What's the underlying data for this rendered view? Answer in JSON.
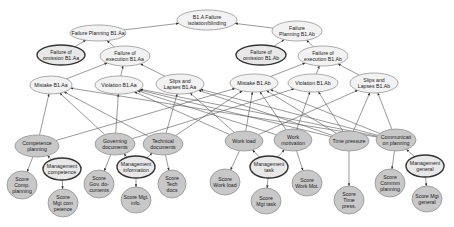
{
  "diagram": {
    "type": "bayesian-network",
    "nodes": [
      {
        "id": "b1a",
        "lines": [
          "B1.A Failure",
          "isolation/blinding"
        ],
        "x": 207,
        "y": 20,
        "rx": 30,
        "ry": 10,
        "style": "white"
      },
      {
        "id": "fp_aa",
        "lines": [
          "Failure Planning B1.Aa"
        ],
        "x": 98,
        "y": 33,
        "rx": 28,
        "ry": 8,
        "style": "white"
      },
      {
        "id": "fp_ab",
        "lines": [
          "Failure",
          "Planning B1.Ab"
        ],
        "x": 297,
        "y": 31,
        "rx": 25,
        "ry": 10,
        "style": "white"
      },
      {
        "id": "fo_aa",
        "lines": [
          "Failure of",
          "omission B1.Aa"
        ],
        "x": 61,
        "y": 55,
        "rx": 24,
        "ry": 10,
        "style": "bold"
      },
      {
        "id": "fe_aa",
        "lines": [
          "Failure of",
          "execution B1.Aa"
        ],
        "x": 125,
        "y": 56,
        "rx": 25,
        "ry": 10,
        "style": "white"
      },
      {
        "id": "fo_ab",
        "lines": [
          "Failure of",
          "omission B1.Ab"
        ],
        "x": 261,
        "y": 55,
        "rx": 25,
        "ry": 10,
        "style": "bold"
      },
      {
        "id": "fe_ab",
        "lines": [
          "Failure of",
          "execution B1.Ab"
        ],
        "x": 323,
        "y": 56,
        "rx": 25,
        "ry": 10,
        "style": "white"
      },
      {
        "id": "mis_aa",
        "lines": [
          "Mistake B1.Aa"
        ],
        "x": 51,
        "y": 85,
        "rx": 21,
        "ry": 9,
        "style": "white"
      },
      {
        "id": "vio_aa",
        "lines": [
          "Violation B1.Aa"
        ],
        "x": 119,
        "y": 85,
        "rx": 24,
        "ry": 9,
        "style": "white"
      },
      {
        "id": "sl_aa",
        "lines": [
          "Slips and",
          "Lapses B1.Aa"
        ],
        "x": 180,
        "y": 84,
        "rx": 24,
        "ry": 10,
        "style": "white"
      },
      {
        "id": "mis_ab",
        "lines": [
          "Mistake B1.Ab"
        ],
        "x": 254,
        "y": 83,
        "rx": 24,
        "ry": 9,
        "style": "white"
      },
      {
        "id": "vio_ab",
        "lines": [
          "Violation B1.Ab"
        ],
        "x": 313,
        "y": 83,
        "rx": 25,
        "ry": 9,
        "style": "white"
      },
      {
        "id": "sl_ab",
        "lines": [
          "Slips and",
          "Lapses B1.Ab"
        ],
        "x": 374,
        "y": 83,
        "rx": 24,
        "ry": 10,
        "style": "white"
      },
      {
        "id": "comp_pl",
        "lines": [
          "Competence",
          "planning"
        ],
        "x": 37,
        "y": 146,
        "rx": 22,
        "ry": 11,
        "style": "grey"
      },
      {
        "id": "gov_doc",
        "lines": [
          "Governing",
          "documents"
        ],
        "x": 115,
        "y": 144,
        "rx": 20,
        "ry": 11,
        "style": "grey"
      },
      {
        "id": "tech_doc",
        "lines": [
          "Technical",
          "documents"
        ],
        "x": 163,
        "y": 144,
        "rx": 20,
        "ry": 11,
        "style": "grey"
      },
      {
        "id": "work_load",
        "lines": [
          "Work load"
        ],
        "x": 244,
        "y": 141,
        "rx": 19,
        "ry": 10,
        "style": "grey"
      },
      {
        "id": "work_mot",
        "lines": [
          "Work",
          "motivation"
        ],
        "x": 293,
        "y": 140,
        "rx": 19,
        "ry": 11,
        "style": "grey"
      },
      {
        "id": "time_pr",
        "lines": [
          "Time pressure"
        ],
        "x": 349,
        "y": 141,
        "rx": 20,
        "ry": 10,
        "style": "grey"
      },
      {
        "id": "comm_pl",
        "lines": [
          "Communicati",
          "on planning"
        ],
        "x": 396,
        "y": 140,
        "rx": 20,
        "ry": 11,
        "style": "grey"
      },
      {
        "id": "mgt_comp",
        "lines": [
          "Management",
          "competence"
        ],
        "x": 62,
        "y": 169,
        "rx": 19,
        "ry": 11,
        "style": "bold"
      },
      {
        "id": "mgt_info",
        "lines": [
          "Management",
          "information"
        ],
        "x": 136,
        "y": 167,
        "rx": 19,
        "ry": 11,
        "style": "bold"
      },
      {
        "id": "mgt_task",
        "lines": [
          "Management",
          "task"
        ],
        "x": 269,
        "y": 167,
        "rx": 19,
        "ry": 11,
        "style": "bold"
      },
      {
        "id": "mgt_gen",
        "lines": [
          "Management",
          "general"
        ],
        "x": 425,
        "y": 166,
        "rx": 19,
        "ry": 11,
        "style": "bold"
      },
      {
        "id": "s_comp",
        "lines": [
          "Score",
          "Comp.",
          "planning"
        ],
        "x": 22,
        "y": 185,
        "rx": 15,
        "ry": 14,
        "style": "grey"
      },
      {
        "id": "s_mgtcomp",
        "lines": [
          "Score",
          "Mgt com",
          "petence"
        ],
        "x": 63,
        "y": 203,
        "rx": 15,
        "ry": 14,
        "style": "grey"
      },
      {
        "id": "s_gov",
        "lines": [
          "Score",
          "Gov. do-",
          "cuments"
        ],
        "x": 99,
        "y": 184,
        "rx": 15,
        "ry": 14,
        "style": "grey"
      },
      {
        "id": "s_mgtinfo",
        "lines": [
          "Score Mgt.",
          "info."
        ],
        "x": 136,
        "y": 200,
        "rx": 15,
        "ry": 13,
        "style": "grey"
      },
      {
        "id": "s_tech",
        "lines": [
          "Score",
          "Tech",
          "docs"
        ],
        "x": 172,
        "y": 184,
        "rx": 14,
        "ry": 14,
        "style": "grey"
      },
      {
        "id": "s_wl",
        "lines": [
          "Score",
          "Work load"
        ],
        "x": 225,
        "y": 182,
        "rx": 15,
        "ry": 13,
        "style": "grey"
      },
      {
        "id": "s_mgttask",
        "lines": [
          "Score",
          "Mgt task"
        ],
        "x": 266,
        "y": 201,
        "rx": 15,
        "ry": 13,
        "style": "grey"
      },
      {
        "id": "s_wm",
        "lines": [
          "Score",
          "Work Mot."
        ],
        "x": 307,
        "y": 183,
        "rx": 15,
        "ry": 13,
        "style": "grey"
      },
      {
        "id": "s_tp",
        "lines": [
          "Score",
          "Time",
          "press."
        ],
        "x": 349,
        "y": 200,
        "rx": 15,
        "ry": 14,
        "style": "grey"
      },
      {
        "id": "s_comm",
        "lines": [
          "Score",
          "Commm",
          "planning"
        ],
        "x": 390,
        "y": 183,
        "rx": 15,
        "ry": 14,
        "style": "grey"
      },
      {
        "id": "s_mgtgen",
        "lines": [
          "Score Mgt",
          "general"
        ],
        "x": 427,
        "y": 199,
        "rx": 15,
        "ry": 13,
        "style": "grey"
      }
    ],
    "edges": [
      [
        "fp_aa",
        "b1a"
      ],
      [
        "fp_ab",
        "b1a"
      ],
      [
        "fo_aa",
        "fp_aa"
      ],
      [
        "fe_aa",
        "fp_aa"
      ],
      [
        "fo_ab",
        "fp_ab"
      ],
      [
        "fe_ab",
        "fp_ab"
      ],
      [
        "mis_aa",
        "fe_aa"
      ],
      [
        "vio_aa",
        "fe_aa"
      ],
      [
        "sl_aa",
        "fe_aa"
      ],
      [
        "mis_ab",
        "fe_ab"
      ],
      [
        "vio_ab",
        "fe_ab"
      ],
      [
        "sl_ab",
        "fe_ab"
      ],
      [
        "comp_pl",
        "mis_aa"
      ],
      [
        "comp_pl",
        "mis_ab"
      ],
      [
        "gov_doc",
        "vio_aa"
      ],
      [
        "gov_doc",
        "mis_aa"
      ],
      [
        "gov_doc",
        "vio_ab"
      ],
      [
        "tech_doc",
        "mis_aa"
      ],
      [
        "tech_doc",
        "sl_aa"
      ],
      [
        "tech_doc",
        "mis_ab"
      ],
      [
        "work_load",
        "vio_aa"
      ],
      [
        "work_load",
        "sl_aa"
      ],
      [
        "work_load",
        "mis_ab"
      ],
      [
        "work_load",
        "sl_ab"
      ],
      [
        "work_mot",
        "vio_aa"
      ],
      [
        "work_mot",
        "vio_ab"
      ],
      [
        "work_mot",
        "mis_ab"
      ],
      [
        "time_pr",
        "vio_aa"
      ],
      [
        "time_pr",
        "sl_aa"
      ],
      [
        "time_pr",
        "vio_ab"
      ],
      [
        "time_pr",
        "sl_ab"
      ],
      [
        "time_pr",
        "mis_ab"
      ],
      [
        "comm_pl",
        "mis_aa"
      ],
      [
        "comm_pl",
        "vio_aa"
      ],
      [
        "comm_pl",
        "sl_aa"
      ],
      [
        "comm_pl",
        "mis_ab"
      ],
      [
        "comm_pl",
        "sl_ab"
      ],
      [
        "comp_pl",
        "s_comp"
      ],
      [
        "mgt_comp",
        "comp_pl"
      ],
      [
        "mgt_comp",
        "s_mgtcomp"
      ],
      [
        "gov_doc",
        "s_gov"
      ],
      [
        "mgt_info",
        "gov_doc"
      ],
      [
        "mgt_info",
        "tech_doc"
      ],
      [
        "mgt_info",
        "s_mgtinfo"
      ],
      [
        "tech_doc",
        "s_tech"
      ],
      [
        "work_load",
        "s_wl"
      ],
      [
        "mgt_task",
        "work_load"
      ],
      [
        "mgt_task",
        "work_mot"
      ],
      [
        "mgt_task",
        "s_mgttask"
      ],
      [
        "work_mot",
        "s_wm"
      ],
      [
        "time_pr",
        "s_tp"
      ],
      [
        "comm_pl",
        "s_comm"
      ],
      [
        "mgt_gen",
        "comm_pl"
      ],
      [
        "mgt_gen",
        "s_mgtgen"
      ]
    ]
  }
}
